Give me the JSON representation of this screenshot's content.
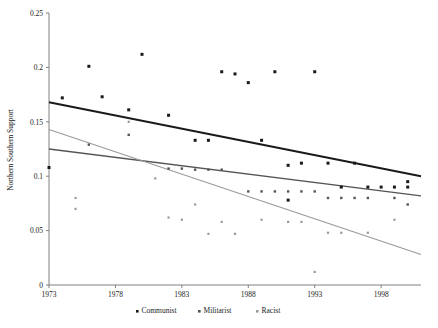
{
  "chart_data": {
    "type": "scatter",
    "title": "",
    "xlabel": "",
    "ylabel": "Northern Southern Support",
    "xlim": [
      1973,
      2001
    ],
    "ylim": [
      0,
      0.25
    ],
    "grid": false,
    "legend_position": "bottom",
    "x_ticks": [
      1973,
      1978,
      1983,
      1988,
      1993,
      1998
    ],
    "x_tick_labels": [
      "1973",
      "1978",
      "1983",
      "1988",
      "1993",
      "1998"
    ],
    "y_ticks": [
      0,
      0.05,
      0.1,
      0.15,
      0.2,
      0.25
    ],
    "y_tick_labels": [
      "0",
      "0.05",
      "0.1",
      "0.15",
      "0.2",
      "0.25"
    ],
    "series": [
      {
        "name": "Communist",
        "color": "#1a1a1a",
        "marker": "square",
        "marker_size": 3.0,
        "points": [
          [
            1973,
            0.108
          ],
          [
            1974,
            0.172
          ],
          [
            1976,
            0.201
          ],
          [
            1977,
            0.173
          ],
          [
            1979,
            0.161
          ],
          [
            1980,
            0.212
          ],
          [
            1982,
            0.156
          ],
          [
            1984,
            0.133
          ],
          [
            1985,
            0.133
          ],
          [
            1986,
            0.196
          ],
          [
            1987,
            0.194
          ],
          [
            1988,
            0.186
          ],
          [
            1989,
            0.133
          ],
          [
            1990,
            0.196
          ],
          [
            1991,
            0.11
          ],
          [
            1991,
            0.078
          ],
          [
            1992,
            0.112
          ],
          [
            1993,
            0.196
          ],
          [
            1994,
            0.112
          ],
          [
            1995,
            0.09
          ],
          [
            1996,
            0.112
          ],
          [
            1997,
            0.09
          ],
          [
            1998,
            0.09
          ],
          [
            1999,
            0.09
          ],
          [
            2000,
            0.095
          ],
          [
            2000,
            0.09
          ]
        ],
        "trend": {
          "x0": 1973,
          "y0": 0.168,
          "x1": 2001,
          "y1": 0.1,
          "width": 2.0
        }
      },
      {
        "name": "Militarist",
        "color": "#555555",
        "marker": "square",
        "marker_size": 2.4,
        "points": [
          [
            1976,
            0.129
          ],
          [
            1979,
            0.138
          ],
          [
            1982,
            0.107
          ],
          [
            1983,
            0.107
          ],
          [
            1984,
            0.106
          ],
          [
            1985,
            0.106
          ],
          [
            1986,
            0.106
          ],
          [
            1988,
            0.086
          ],
          [
            1989,
            0.086
          ],
          [
            1990,
            0.086
          ],
          [
            1991,
            0.086
          ],
          [
            1992,
            0.086
          ],
          [
            1993,
            0.086
          ],
          [
            1994,
            0.08
          ],
          [
            1995,
            0.08
          ],
          [
            1996,
            0.08
          ],
          [
            1997,
            0.08
          ],
          [
            1999,
            0.08
          ],
          [
            2000,
            0.074
          ]
        ],
        "trend": {
          "x0": 1973,
          "y0": 0.125,
          "x1": 2001,
          "y1": 0.082,
          "width": 1.3
        }
      },
      {
        "name": "Racist",
        "color": "#9a9a9a",
        "marker": "square",
        "marker_size": 2.2,
        "points": [
          [
            1975,
            0.08
          ],
          [
            1975,
            0.07
          ],
          [
            1979,
            0.15
          ],
          [
            1981,
            0.098
          ],
          [
            1982,
            0.062
          ],
          [
            1983,
            0.06
          ],
          [
            1984,
            0.074
          ],
          [
            1985,
            0.047
          ],
          [
            1986,
            0.058
          ],
          [
            1987,
            0.047
          ],
          [
            1989,
            0.06
          ],
          [
            1991,
            0.058
          ],
          [
            1992,
            0.058
          ],
          [
            1993,
            0.012
          ],
          [
            1994,
            0.048
          ],
          [
            1995,
            0.048
          ],
          [
            1997,
            0.048
          ],
          [
            1999,
            0.06
          ]
        ],
        "trend": {
          "x0": 1973,
          "y0": 0.143,
          "x1": 2001,
          "y1": 0.028,
          "width": 1.1
        }
      }
    ]
  },
  "legend": {
    "entries": [
      {
        "label": "Communist",
        "color": "#1a1a1a"
      },
      {
        "label": "Militarist",
        "color": "#555555"
      },
      {
        "label": "Racist",
        "color": "#9a9a9a"
      }
    ]
  }
}
